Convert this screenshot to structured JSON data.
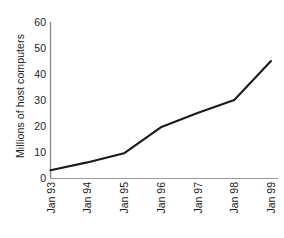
{
  "chart_data": {
    "type": "line",
    "title": "",
    "xlabel": "",
    "ylabel": "Millions of host computers",
    "categories": [
      "Jan 93",
      "Jan 94",
      "Jan 95",
      "Jan 96",
      "Jan 97",
      "Jan 98",
      "Jan 99"
    ],
    "values": [
      3,
      6,
      9.5,
      19.5,
      25,
      30,
      45
    ],
    "series": [
      {
        "name": "Millions of host computers",
        "values": [
          3,
          6,
          9.5,
          19.5,
          25,
          30,
          45
        ]
      }
    ],
    "ylim": [
      0,
      60
    ],
    "yticks": [
      0,
      10,
      20,
      30,
      40,
      50,
      60
    ],
    "ytick_labels": [
      "0",
      "10",
      "20",
      "30",
      "40",
      "50",
      "60"
    ],
    "grid": false,
    "legend": false,
    "legend_position": "none",
    "line_color": "#1a1a1a",
    "axis_color": "#8c8c8c",
    "background_color": "#ffffff",
    "markers": false
  }
}
